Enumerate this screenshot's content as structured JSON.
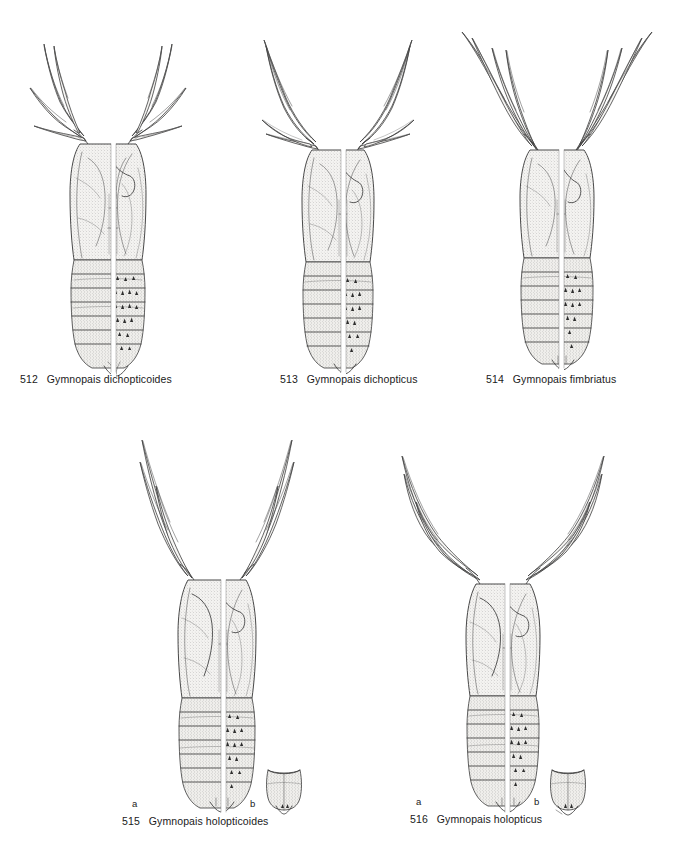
{
  "plate": {
    "background": "#ffffff",
    "ink_color": "#3b3b3b",
    "description": "Plate of black fly (Simuliidae) pupae, genus Gymnopais; each drawing split longitudinally, left half dorsal and right half ventral"
  },
  "figures": [
    {
      "number": "512",
      "genus": "Gymnopais",
      "species": "dichopticoides",
      "caption": "Gymnopais dichopticoides",
      "row": 1,
      "gill_style": "short-branched",
      "gill_filaments": 4,
      "body_segments": 9,
      "has_insets": false,
      "sublabels": []
    },
    {
      "number": "513",
      "genus": "Gymnopais",
      "species": "dichopticus",
      "caption": "Gymnopais dichopticus",
      "row": 1,
      "gill_style": "medium-branched",
      "gill_filaments": 4,
      "body_segments": 9,
      "has_insets": false,
      "sublabels": []
    },
    {
      "number": "514",
      "genus": "Gymnopais",
      "species": "fimbriatus",
      "caption": "Gymnopais fimbriatus",
      "row": 1,
      "gill_style": "long-slender",
      "gill_filaments": 4,
      "body_segments": 9,
      "has_insets": false,
      "sublabels": []
    },
    {
      "number": "515",
      "genus": "Gymnopais",
      "species": "holopticoides",
      "caption": "Gymnopais holopticoides",
      "row": 2,
      "gill_style": "long-slender",
      "gill_filaments": 3,
      "body_segments": 9,
      "has_insets": true,
      "sublabels": [
        "a",
        "b"
      ]
    },
    {
      "number": "516",
      "genus": "Gymnopais",
      "species": "holopticus",
      "caption": "Gymnopais holopticus",
      "row": 2,
      "gill_style": "long-curved",
      "gill_filaments": 3,
      "body_segments": 9,
      "has_insets": true,
      "sublabels": [
        "a",
        "b"
      ]
    }
  ]
}
